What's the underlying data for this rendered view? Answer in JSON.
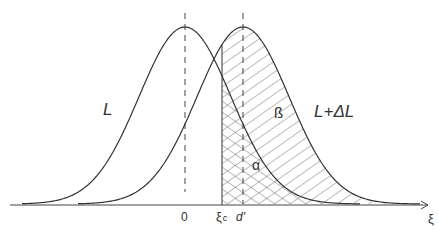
{
  "diagram": {
    "type": "overlapping normal distributions with shaded regions",
    "curves": [
      {
        "id": "L",
        "label": "L",
        "mean_label": "0"
      },
      {
        "id": "L+dL",
        "label": "L+ΔL",
        "mean_label": "d'"
      }
    ],
    "regions": {
      "alpha": {
        "label": "α",
        "description": "area under L to the right of ξc (cross-hatched)"
      },
      "beta": {
        "label": "β",
        "description": "area under L+ΔL to the right of ξc (hatched)"
      }
    },
    "axis": {
      "label": "ξ",
      "ticks": [
        "0",
        "ξc",
        "d'"
      ]
    },
    "colors": {
      "line": "#333333",
      "background": "#ffffff"
    }
  },
  "labels": {
    "curve_L": "L",
    "curve_LdL": "L+ΔL",
    "beta": "ß",
    "alpha": "α",
    "tick_zero": "0",
    "tick_xic_main": "ξ",
    "tick_xic_sub": "c",
    "tick_d": "d'",
    "axis_xi": "ξ"
  }
}
